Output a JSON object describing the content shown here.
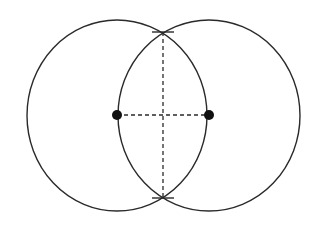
{
  "diagram": {
    "type": "perpendicular-bisector-construction",
    "canvas": {
      "width": 317,
      "height": 230,
      "background": "#ffffff"
    },
    "stroke_color": "#2a2a2a",
    "circles": [
      {
        "id": "left-circle",
        "cx": 117,
        "cy": 115.5,
        "rx": 90,
        "ry": 95.5
      },
      {
        "id": "right-circle",
        "cx": 209,
        "cy": 115.5,
        "rx": 91,
        "ry": 95.5
      }
    ],
    "points": [
      {
        "id": "left-center-point",
        "x": 117,
        "y": 115,
        "r": 5
      },
      {
        "id": "right-center-point",
        "x": 209,
        "y": 115,
        "r": 5
      }
    ],
    "dashed_segments": [
      {
        "id": "horizontal-center-segment",
        "x1": 117,
        "y1": 115,
        "x2": 209,
        "y2": 115
      },
      {
        "id": "vertical-bisector-segment",
        "x1": 163,
        "y1": 32,
        "x2": 163,
        "y2": 198
      }
    ],
    "tick_marks": [
      {
        "id": "top-intersection-tick",
        "x1": 152,
        "y1": 32,
        "x2": 174,
        "y2": 32
      },
      {
        "id": "bottom-intersection-tick",
        "x1": 152,
        "y1": 198,
        "x2": 174,
        "y2": 198
      }
    ]
  }
}
